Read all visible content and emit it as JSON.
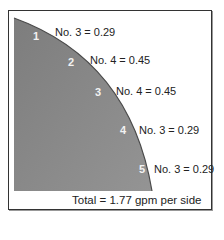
{
  "diagram": {
    "colors": {
      "area": "#8a8a8a",
      "curve": "#4a4a4a",
      "border": "#333333",
      "text": "#222222",
      "number": "#f2f2f2"
    },
    "zones": [
      {
        "number": "1",
        "label": "No. 3 = 0.29"
      },
      {
        "number": "2",
        "label": "No. 4 = 0.45"
      },
      {
        "number": "3",
        "label": "No. 4 = 0.45"
      },
      {
        "number": "4",
        "label": "No. 3 = 0.29"
      },
      {
        "number": "5",
        "label": "No. 3 = 0.29"
      }
    ],
    "total": "Total = 1.77 gpm per side"
  }
}
